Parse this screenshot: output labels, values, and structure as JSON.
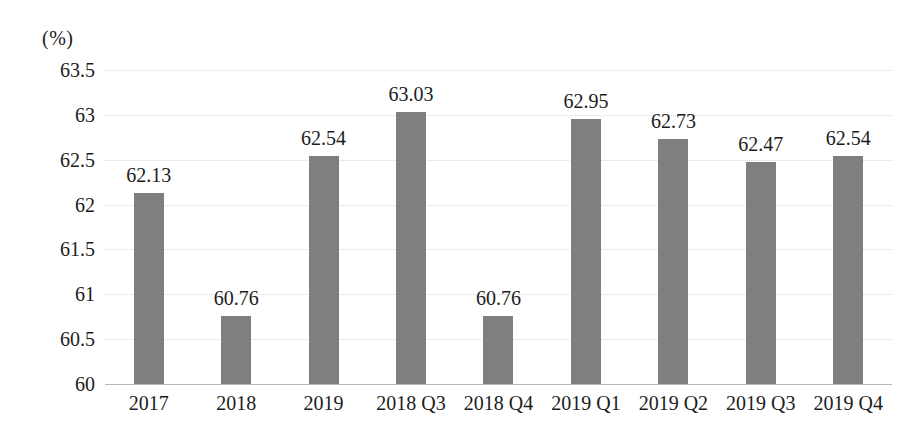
{
  "chart_data": {
    "type": "bar",
    "title": "",
    "subtitle": "",
    "unit_label": "(%)",
    "xlabel": "",
    "ylabel": "",
    "ylim": [
      60,
      63.5
    ],
    "ytick_step": 0.5,
    "yticks": [
      "63.5",
      "63",
      "62.5",
      "62",
      "61.5",
      "61",
      "60.5",
      "60"
    ],
    "ytick_values": [
      63.5,
      63,
      62.5,
      62,
      61.5,
      61,
      60.5,
      60
    ],
    "grid": true,
    "grid_style": "dotted",
    "legend": false,
    "legend_position": "none",
    "categories": [
      "2017",
      "2018",
      "2019",
      "2018 Q3",
      "2018 Q4",
      "2019 Q1",
      "2019 Q2",
      "2019 Q3",
      "2019 Q4"
    ],
    "values": [
      62.13,
      60.76,
      62.54,
      63.03,
      60.76,
      62.95,
      62.73,
      62.47,
      62.54
    ],
    "data_labels": [
      "62.13",
      "60.76",
      "62.54",
      "63.03",
      "60.76",
      "62.95",
      "62.73",
      "62.47",
      "62.54"
    ],
    "series": [
      {
        "name": "",
        "color": "#7f7f7f",
        "values": [
          62.13,
          60.76,
          62.54,
          63.03,
          60.76,
          62.95,
          62.73,
          62.47,
          62.54
        ]
      }
    ]
  },
  "colors": {
    "bar": "#7f7f7f",
    "gridline": "#d8d8d8",
    "baseline": "#b8b8b8",
    "text": "#1c1c1c",
    "background": "#ffffff"
  }
}
